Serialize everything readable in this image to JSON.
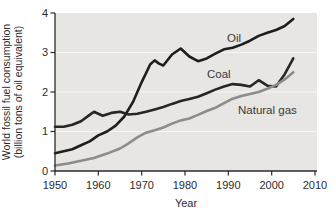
{
  "chart_data": {
    "type": "line",
    "title": "",
    "xlabel": "Year",
    "ylabel": "World fossil fuel consumption (billion tons of oil equivalent)",
    "ylabel_lines": [
      "World fossil fuel consumption",
      "(billion tons of oil equivalent)"
    ],
    "xlim": [
      1950,
      2010
    ],
    "ylim": [
      0,
      4
    ],
    "x_ticks": [
      1950,
      1960,
      1970,
      1980,
      1990,
      2000,
      2010
    ],
    "y_ticks": [
      0,
      1,
      2,
      3,
      4
    ],
    "grid": "horizontal-white-lines-at-integers",
    "legend_position": "inline-labels-on-plot",
    "plot_bg_color": "#e8e6e3",
    "grid_color": "#f7f6f4",
    "axis_color": "#2b2b2b",
    "series": [
      {
        "name": "Oil",
        "color": "#1e1e1e",
        "points": [
          [
            1950,
            0.45
          ],
          [
            1952,
            0.5
          ],
          [
            1954,
            0.55
          ],
          [
            1956,
            0.65
          ],
          [
            1958,
            0.75
          ],
          [
            1960,
            0.9
          ],
          [
            1962,
            1.0
          ],
          [
            1964,
            1.15
          ],
          [
            1966,
            1.38
          ],
          [
            1968,
            1.75
          ],
          [
            1970,
            2.25
          ],
          [
            1972,
            2.7
          ],
          [
            1973,
            2.8
          ],
          [
            1974,
            2.72
          ],
          [
            1975,
            2.67
          ],
          [
            1977,
            2.95
          ],
          [
            1979,
            3.1
          ],
          [
            1981,
            2.9
          ],
          [
            1983,
            2.78
          ],
          [
            1985,
            2.85
          ],
          [
            1987,
            2.97
          ],
          [
            1989,
            3.08
          ],
          [
            1991,
            3.12
          ],
          [
            1993,
            3.2
          ],
          [
            1995,
            3.3
          ],
          [
            1997,
            3.42
          ],
          [
            1999,
            3.5
          ],
          [
            2001,
            3.57
          ],
          [
            2003,
            3.67
          ],
          [
            2005,
            3.85
          ]
        ]
      },
      {
        "name": "Coal",
        "color": "#262626",
        "points": [
          [
            1950,
            1.12
          ],
          [
            1952,
            1.12
          ],
          [
            1954,
            1.17
          ],
          [
            1956,
            1.26
          ],
          [
            1958,
            1.42
          ],
          [
            1959,
            1.5
          ],
          [
            1961,
            1.4
          ],
          [
            1963,
            1.47
          ],
          [
            1965,
            1.5
          ],
          [
            1967,
            1.43
          ],
          [
            1969,
            1.45
          ],
          [
            1971,
            1.5
          ],
          [
            1973,
            1.56
          ],
          [
            1975,
            1.62
          ],
          [
            1977,
            1.7
          ],
          [
            1979,
            1.77
          ],
          [
            1981,
            1.82
          ],
          [
            1983,
            1.88
          ],
          [
            1985,
            1.97
          ],
          [
            1987,
            2.06
          ],
          [
            1989,
            2.14
          ],
          [
            1991,
            2.2
          ],
          [
            1993,
            2.18
          ],
          [
            1995,
            2.14
          ],
          [
            1997,
            2.3
          ],
          [
            1999,
            2.16
          ],
          [
            2001,
            2.14
          ],
          [
            2003,
            2.45
          ],
          [
            2005,
            2.85
          ]
        ]
      },
      {
        "name": "Natural gas",
        "color": "#8c8c8c",
        "points": [
          [
            1950,
            0.14
          ],
          [
            1953,
            0.19
          ],
          [
            1956,
            0.26
          ],
          [
            1959,
            0.33
          ],
          [
            1962,
            0.44
          ],
          [
            1965,
            0.57
          ],
          [
            1967,
            0.7
          ],
          [
            1969,
            0.85
          ],
          [
            1971,
            0.97
          ],
          [
            1973,
            1.03
          ],
          [
            1975,
            1.1
          ],
          [
            1977,
            1.2
          ],
          [
            1979,
            1.28
          ],
          [
            1981,
            1.33
          ],
          [
            1983,
            1.42
          ],
          [
            1985,
            1.52
          ],
          [
            1987,
            1.6
          ],
          [
            1989,
            1.72
          ],
          [
            1991,
            1.83
          ],
          [
            1993,
            1.9
          ],
          [
            1995,
            1.95
          ],
          [
            1997,
            2.0
          ],
          [
            1999,
            2.08
          ],
          [
            2001,
            2.18
          ],
          [
            2003,
            2.32
          ],
          [
            2005,
            2.5
          ]
        ]
      }
    ]
  }
}
